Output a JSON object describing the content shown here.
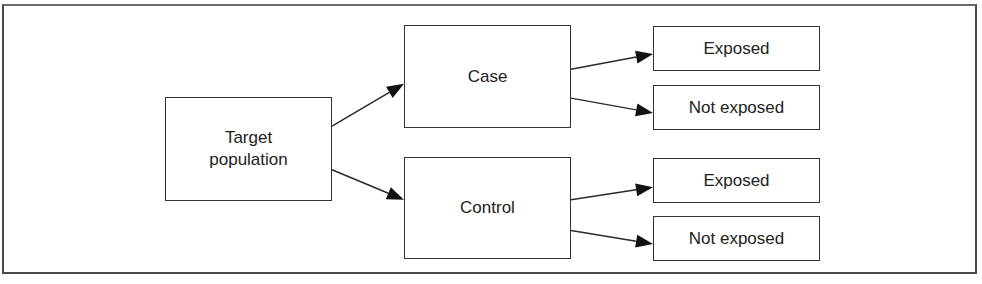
{
  "diagram": {
    "type": "flowchart",
    "colors": {
      "stroke": "#333333",
      "text": "#222222",
      "background": "#ffffff",
      "arrowhead": "#111111"
    },
    "nodes": {
      "target": {
        "id": "target",
        "lines": [
          "Target",
          "population"
        ]
      },
      "case": {
        "id": "case",
        "label": "Case"
      },
      "control": {
        "id": "control",
        "label": "Control"
      },
      "case_exposed": {
        "id": "case_exposed",
        "label": "Exposed"
      },
      "case_not_exposed": {
        "id": "case_not_exposed",
        "label": "Not exposed"
      },
      "control_exposed": {
        "id": "control_exposed",
        "label": "Exposed"
      },
      "control_not_exposed": {
        "id": "control_not_exposed",
        "label": "Not exposed"
      }
    },
    "edges": [
      {
        "from": "target",
        "to": "case"
      },
      {
        "from": "target",
        "to": "control"
      },
      {
        "from": "case",
        "to": "case_exposed"
      },
      {
        "from": "case",
        "to": "case_not_exposed"
      },
      {
        "from": "control",
        "to": "control_exposed"
      },
      {
        "from": "control",
        "to": "control_not_exposed"
      }
    ]
  }
}
